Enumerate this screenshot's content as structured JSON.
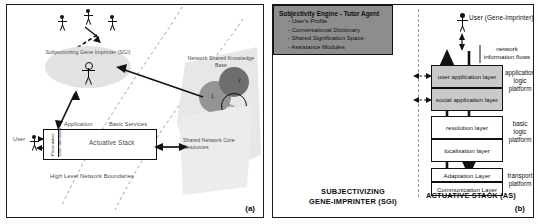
{
  "figure": {
    "panel_a_label": "(a)",
    "panel_b_label": "(b)"
  },
  "panel_a": {
    "nodes": {
      "sgi_cloud": "Subjectivizing Gene Imprinter (SGI)",
      "knowledge_base": "Network Shared Knowledge Base",
      "kb_circle_1": "1",
      "kb_circle_2": "2",
      "kb_circle_etc": "Etc",
      "core_resources": "Shared Network Core Resources",
      "actuative_stack": "Actuative Stack",
      "application": "Application",
      "basic_services": "Basic Services",
      "user": "User",
      "strip_1": "Presentation",
      "strip_2": "User Interaction",
      "boundaries": "High Level Network Boundaries"
    }
  },
  "panel_b": {
    "user_label": "User (Gene-Imprinter)",
    "flow_label_line1": "network",
    "flow_label_line2": "information flows",
    "subjectivity_engine": {
      "title": "Subjectivity Engine - Tutor Agent",
      "items": [
        "- User's Profile",
        "- Conversational Dictionary",
        "- Shared Signification Space",
        "- Assistance Modules"
      ]
    },
    "layers": [
      "user application layer",
      "social application layer",
      "resolution layer",
      "localisation layer",
      "Adaptation Layer",
      "Communication Layer"
    ],
    "platforms": [
      {
        "line1": "application",
        "line2": "logic",
        "line3": "platform"
      },
      {
        "line1": "basic",
        "line2": "logic",
        "line3": "platform"
      },
      {
        "line1": "transport",
        "line2": "platform",
        "line3": ""
      }
    ],
    "captions": {
      "left_line1": "SUBJECTIVIZING",
      "left_line2": "GENE-IMPRINTER (SGI)",
      "right": "ACTUATIVE STACK (AS)"
    }
  },
  "colors": {
    "engine_fill": "#8d8d8d",
    "app_layer_fill": "#c9c9c9",
    "cloud_fill": "#e2e2e2",
    "kb_circle_1": "#949494",
    "kb_circle_2": "#6e6e6e",
    "stroke": "#111111"
  }
}
